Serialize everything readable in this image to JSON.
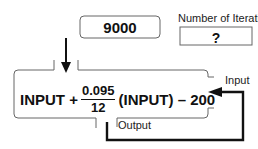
{
  "diagram": {
    "start_box": {
      "value": "9000"
    },
    "iterations": {
      "label": "Number of Iterations",
      "value": "?"
    },
    "function_machine": {
      "formula": {
        "term1": "INPUT +",
        "fraction_numerator": "0.095",
        "fraction_denominator": "12",
        "term2": "(INPUT) – 200"
      },
      "input_label": "Input",
      "output_label": "Output"
    },
    "colors": {
      "stroke": "#111111",
      "box_border": "#666666"
    }
  }
}
